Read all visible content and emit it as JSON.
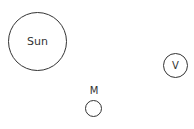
{
  "diagram": {
    "bodies": [
      {
        "id": "sun",
        "label": "Sun",
        "label_position": "inside"
      },
      {
        "id": "venus",
        "label": "V",
        "label_position": "inside"
      },
      {
        "id": "mercury",
        "label": "M",
        "label_position": "above"
      }
    ]
  }
}
